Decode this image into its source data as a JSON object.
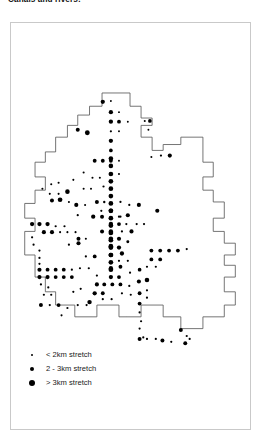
{
  "figure": {
    "title": "Canals and rivers:",
    "frame_color": "#c9c9c9",
    "background": "#ffffff"
  },
  "map": {
    "name": "canals-and-rivers-dot-density-map",
    "boundary_color": "#555555",
    "grid_color": "#b0b0b0",
    "dot_color": "#000000",
    "grid": {
      "vertical_x": [
        62,
        110,
        158,
        206
      ],
      "horizontal_y": [
        98,
        168,
        238,
        302,
        362
      ]
    },
    "boundary_path": "M 125 18 L 163 18 L 163 36 L 178 36 L 178 52 L 193 52 L 193 62 L 178 62 L 178 78 L 193 78 L 193 96 L 208 96 L 208 88 L 232 88 L 232 78 L 262 78 L 262 112 L 276 112 L 276 132 L 262 132 L 262 150 L 276 150 L 276 166 L 291 166 L 291 188 L 276 188 L 276 206 L 291 206 L 291 222 L 306 222 L 306 238 L 291 238 L 291 252 L 306 252 L 306 268 L 291 268 L 291 288 L 306 288 L 306 306 L 291 306 L 291 322 L 262 322 L 262 338 L 232 338 L 232 322 L 208 322 L 208 306 L 178 306 L 178 322 L 148 322 L 148 306 L 118 306 L 118 322 L 88 322 L 88 306 L 62 306 L 62 288 L 48 288 L 48 268 L 34 268 L 34 238 L 20 238 L 20 206 L 34 206 L 34 188 L 20 188 L 20 168 L 34 168 L 34 150 L 48 150 L 48 132 L 34 132 L 34 112 L 48 112 L 48 98 L 62 98 L 62 78 L 78 78 L 78 62 L 92 62 L 92 48 L 108 48 L 108 36 L 125 36 Z",
    "legend": {
      "title": "",
      "items": [
        {
          "size_px": 2.4,
          "label": "< 2km stretch",
          "category": "small"
        },
        {
          "size_px": 4.4,
          "label": "2 - 3km stretch",
          "category": "medium"
        },
        {
          "size_px": 6.4,
          "label": "> 3km stretch",
          "category": "large"
        }
      ]
    },
    "dots": [
      {
        "x": 126,
        "y": 30,
        "r": 2.9
      },
      {
        "x": 137,
        "y": 29,
        "r": 1.3
      },
      {
        "x": 137,
        "y": 44,
        "r": 2.9
      },
      {
        "x": 148,
        "y": 44,
        "r": 1.3
      },
      {
        "x": 137,
        "y": 57,
        "r": 2.9
      },
      {
        "x": 148,
        "y": 57,
        "r": 2.6
      },
      {
        "x": 160,
        "y": 57,
        "r": 1.3
      },
      {
        "x": 183,
        "y": 56,
        "r": 1.4
      },
      {
        "x": 190,
        "y": 56,
        "r": 2.5
      },
      {
        "x": 137,
        "y": 70,
        "r": 1.5
      },
      {
        "x": 148,
        "y": 70,
        "r": 1.3
      },
      {
        "x": 188,
        "y": 68,
        "r": 1.3
      },
      {
        "x": 92,
        "y": 68,
        "r": 2.7
      },
      {
        "x": 105,
        "y": 72,
        "r": 3.3
      },
      {
        "x": 137,
        "y": 83,
        "r": 2.9
      },
      {
        "x": 137,
        "y": 96,
        "r": 2.5
      },
      {
        "x": 137,
        "y": 107,
        "r": 3.1
      },
      {
        "x": 137,
        "y": 117,
        "r": 3.1
      },
      {
        "x": 115,
        "y": 110,
        "r": 2.6
      },
      {
        "x": 126,
        "y": 110,
        "r": 2.6
      },
      {
        "x": 137,
        "y": 110,
        "r": 2.6
      },
      {
        "x": 148,
        "y": 110,
        "r": 1.3
      },
      {
        "x": 192,
        "y": 105,
        "r": 1.4
      },
      {
        "x": 205,
        "y": 103,
        "r": 1.5
      },
      {
        "x": 217,
        "y": 103,
        "r": 2.8
      },
      {
        "x": 137,
        "y": 128,
        "r": 3.2
      },
      {
        "x": 137,
        "y": 138,
        "r": 3.2
      },
      {
        "x": 137,
        "y": 148,
        "r": 3.2
      },
      {
        "x": 137,
        "y": 158,
        "r": 3.2
      },
      {
        "x": 137,
        "y": 168,
        "r": 3.2
      },
      {
        "x": 137,
        "y": 178,
        "r": 3.2
      },
      {
        "x": 137,
        "y": 188,
        "r": 3.2
      },
      {
        "x": 137,
        "y": 198,
        "r": 3.2
      },
      {
        "x": 137,
        "y": 208,
        "r": 3.2
      },
      {
        "x": 137,
        "y": 218,
        "r": 3.2
      },
      {
        "x": 137,
        "y": 228,
        "r": 3.2
      },
      {
        "x": 137,
        "y": 238,
        "r": 3.2
      },
      {
        "x": 137,
        "y": 248,
        "r": 3.2
      },
      {
        "x": 137,
        "y": 258,
        "r": 3.2
      },
      {
        "x": 44,
        "y": 148,
        "r": 1.4
      },
      {
        "x": 54,
        "y": 155,
        "r": 1.4
      },
      {
        "x": 66,
        "y": 155,
        "r": 1.4
      },
      {
        "x": 78,
        "y": 152,
        "r": 3.1
      },
      {
        "x": 100,
        "y": 148,
        "r": 1.4
      },
      {
        "x": 110,
        "y": 148,
        "r": 1.4
      },
      {
        "x": 127,
        "y": 145,
        "r": 1.5
      },
      {
        "x": 57,
        "y": 164,
        "r": 2.7
      },
      {
        "x": 68,
        "y": 163,
        "r": 3.2
      },
      {
        "x": 80,
        "y": 166,
        "r": 1.4
      },
      {
        "x": 90,
        "y": 170,
        "r": 2.8
      },
      {
        "x": 102,
        "y": 170,
        "r": 1.4
      },
      {
        "x": 118,
        "y": 166,
        "r": 2.7
      },
      {
        "x": 128,
        "y": 166,
        "r": 1.6
      },
      {
        "x": 150,
        "y": 166,
        "r": 1.5
      },
      {
        "x": 162,
        "y": 170,
        "r": 1.5
      },
      {
        "x": 175,
        "y": 170,
        "r": 2.8
      },
      {
        "x": 124,
        "y": 178,
        "r": 1.5
      },
      {
        "x": 137,
        "y": 178,
        "r": 3.0
      },
      {
        "x": 113,
        "y": 186,
        "r": 2.9
      },
      {
        "x": 125,
        "y": 186,
        "r": 2.7
      },
      {
        "x": 150,
        "y": 186,
        "r": 1.5
      },
      {
        "x": 160,
        "y": 184,
        "r": 2.8
      },
      {
        "x": 92,
        "y": 184,
        "r": 1.5
      },
      {
        "x": 30,
        "y": 196,
        "r": 2.9
      },
      {
        "x": 40,
        "y": 196,
        "r": 2.9
      },
      {
        "x": 51,
        "y": 196,
        "r": 2.9
      },
      {
        "x": 62,
        "y": 199,
        "r": 1.5
      },
      {
        "x": 74,
        "y": 199,
        "r": 1.5
      },
      {
        "x": 137,
        "y": 196,
        "r": 3.0
      },
      {
        "x": 148,
        "y": 196,
        "r": 2.6
      },
      {
        "x": 158,
        "y": 196,
        "r": 1.5
      },
      {
        "x": 46,
        "y": 207,
        "r": 2.8
      },
      {
        "x": 57,
        "y": 207,
        "r": 2.8
      },
      {
        "x": 68,
        "y": 207,
        "r": 1.4
      },
      {
        "x": 78,
        "y": 207,
        "r": 1.4
      },
      {
        "x": 89,
        "y": 207,
        "r": 1.4
      },
      {
        "x": 125,
        "y": 206,
        "r": 2.7
      },
      {
        "x": 137,
        "y": 206,
        "r": 3.0
      },
      {
        "x": 93,
        "y": 216,
        "r": 2.7
      },
      {
        "x": 103,
        "y": 216,
        "r": 1.4
      },
      {
        "x": 137,
        "y": 216,
        "r": 3.1
      },
      {
        "x": 148,
        "y": 216,
        "r": 2.8
      },
      {
        "x": 160,
        "y": 220,
        "r": 2.0
      },
      {
        "x": 32,
        "y": 224,
        "r": 1.5
      },
      {
        "x": 40,
        "y": 232,
        "r": 1.5
      },
      {
        "x": 80,
        "y": 224,
        "r": 1.5
      },
      {
        "x": 93,
        "y": 222,
        "r": 2.8
      },
      {
        "x": 137,
        "y": 226,
        "r": 3.2
      },
      {
        "x": 148,
        "y": 228,
        "r": 2.9
      },
      {
        "x": 40,
        "y": 242,
        "r": 1.5
      },
      {
        "x": 40,
        "y": 250,
        "r": 1.5
      },
      {
        "x": 103,
        "y": 240,
        "r": 1.5
      },
      {
        "x": 115,
        "y": 240,
        "r": 2.6
      },
      {
        "x": 137,
        "y": 238,
        "r": 3.2
      },
      {
        "x": 152,
        "y": 236,
        "r": 2.9
      },
      {
        "x": 40,
        "y": 258,
        "r": 2.8
      },
      {
        "x": 51,
        "y": 258,
        "r": 2.6
      },
      {
        "x": 62,
        "y": 258,
        "r": 2.6
      },
      {
        "x": 73,
        "y": 258,
        "r": 2.6
      },
      {
        "x": 84,
        "y": 258,
        "r": 1.5
      },
      {
        "x": 95,
        "y": 256,
        "r": 1.5
      },
      {
        "x": 107,
        "y": 256,
        "r": 1.5
      },
      {
        "x": 137,
        "y": 256,
        "r": 2.9
      },
      {
        "x": 150,
        "y": 254,
        "r": 2.6
      },
      {
        "x": 40,
        "y": 268,
        "r": 2.8
      },
      {
        "x": 51,
        "y": 268,
        "r": 2.8
      },
      {
        "x": 62,
        "y": 268,
        "r": 2.6
      },
      {
        "x": 73,
        "y": 268,
        "r": 2.6
      },
      {
        "x": 84,
        "y": 268,
        "r": 2.6
      },
      {
        "x": 118,
        "y": 266,
        "r": 1.5
      },
      {
        "x": 137,
        "y": 268,
        "r": 2.9
      },
      {
        "x": 148,
        "y": 268,
        "r": 2.6
      },
      {
        "x": 163,
        "y": 262,
        "r": 1.5
      },
      {
        "x": 176,
        "y": 258,
        "r": 2.5
      },
      {
        "x": 42,
        "y": 278,
        "r": 1.5
      },
      {
        "x": 52,
        "y": 282,
        "r": 1.5
      },
      {
        "x": 118,
        "y": 278,
        "r": 2.8
      },
      {
        "x": 128,
        "y": 278,
        "r": 2.6
      },
      {
        "x": 139,
        "y": 278,
        "r": 2.6
      },
      {
        "x": 150,
        "y": 278,
        "r": 2.6
      },
      {
        "x": 162,
        "y": 280,
        "r": 1.5
      },
      {
        "x": 175,
        "y": 274,
        "r": 2.8
      },
      {
        "x": 186,
        "y": 272,
        "r": 3.1
      },
      {
        "x": 46,
        "y": 292,
        "r": 1.5
      },
      {
        "x": 56,
        "y": 292,
        "r": 1.5
      },
      {
        "x": 115,
        "y": 290,
        "r": 2.9
      },
      {
        "x": 126,
        "y": 290,
        "r": 2.6
      },
      {
        "x": 152,
        "y": 290,
        "r": 1.5
      },
      {
        "x": 164,
        "y": 292,
        "r": 1.5
      },
      {
        "x": 176,
        "y": 290,
        "r": 2.6
      },
      {
        "x": 108,
        "y": 302,
        "r": 3.0
      },
      {
        "x": 42,
        "y": 306,
        "r": 2.7
      },
      {
        "x": 54,
        "y": 306,
        "r": 1.5
      },
      {
        "x": 66,
        "y": 306,
        "r": 2.6
      },
      {
        "x": 78,
        "y": 310,
        "r": 1.5
      },
      {
        "x": 92,
        "y": 306,
        "r": 1.5
      },
      {
        "x": 104,
        "y": 306,
        "r": 1.5
      },
      {
        "x": 176,
        "y": 304,
        "r": 2.6
      },
      {
        "x": 176,
        "y": 316,
        "r": 1.5
      },
      {
        "x": 178,
        "y": 328,
        "r": 1.5
      },
      {
        "x": 176,
        "y": 338,
        "r": 1.5
      },
      {
        "x": 181,
        "y": 350,
        "r": 1.5
      },
      {
        "x": 176,
        "y": 352,
        "r": 2.7
      },
      {
        "x": 186,
        "y": 352,
        "r": 1.5
      },
      {
        "x": 198,
        "y": 352,
        "r": 1.5
      },
      {
        "x": 207,
        "y": 354,
        "r": 2.7
      },
      {
        "x": 219,
        "y": 356,
        "r": 1.5
      },
      {
        "x": 232,
        "y": 340,
        "r": 2.7
      },
      {
        "x": 240,
        "y": 348,
        "r": 1.5
      },
      {
        "x": 238,
        "y": 358,
        "r": 2.7
      },
      {
        "x": 244,
        "y": 352,
        "r": 1.5
      },
      {
        "x": 192,
        "y": 232,
        "r": 2.6
      },
      {
        "x": 204,
        "y": 232,
        "r": 2.6
      },
      {
        "x": 216,
        "y": 232,
        "r": 2.6
      },
      {
        "x": 228,
        "y": 232,
        "r": 2.6
      },
      {
        "x": 240,
        "y": 230,
        "r": 1.5
      },
      {
        "x": 192,
        "y": 244,
        "r": 2.6
      },
      {
        "x": 204,
        "y": 244,
        "r": 2.6
      },
      {
        "x": 186,
        "y": 254,
        "r": 1.5
      },
      {
        "x": 198,
        "y": 254,
        "r": 1.5
      },
      {
        "x": 186,
        "y": 286,
        "r": 1.5
      },
      {
        "x": 186,
        "y": 296,
        "r": 1.5
      },
      {
        "x": 165,
        "y": 206,
        "r": 2.8
      },
      {
        "x": 152,
        "y": 206,
        "r": 1.5
      },
      {
        "x": 148,
        "y": 186,
        "r": 1.5
      },
      {
        "x": 200,
        "y": 178,
        "r": 2.8
      },
      {
        "x": 112,
        "y": 133,
        "r": 1.4
      },
      {
        "x": 122,
        "y": 133,
        "r": 1.4
      },
      {
        "x": 86,
        "y": 136,
        "r": 1.4
      },
      {
        "x": 66,
        "y": 140,
        "r": 1.4
      },
      {
        "x": 56,
        "y": 142,
        "r": 1.4
      },
      {
        "x": 172,
        "y": 196,
        "r": 1.5
      },
      {
        "x": 182,
        "y": 196,
        "r": 1.5
      },
      {
        "x": 148,
        "y": 246,
        "r": 1.5
      },
      {
        "x": 160,
        "y": 246,
        "r": 1.5
      },
      {
        "x": 96,
        "y": 284,
        "r": 1.5
      },
      {
        "x": 86,
        "y": 288,
        "r": 1.5
      },
      {
        "x": 126,
        "y": 298,
        "r": 1.5
      },
      {
        "x": 138,
        "y": 298,
        "r": 1.5
      },
      {
        "x": 70,
        "y": 320,
        "r": 1.4
      },
      {
        "x": 30,
        "y": 214,
        "r": 1.5
      },
      {
        "x": 100,
        "y": 126,
        "r": 1.4
      },
      {
        "x": 148,
        "y": 128,
        "r": 1.4
      }
    ]
  }
}
